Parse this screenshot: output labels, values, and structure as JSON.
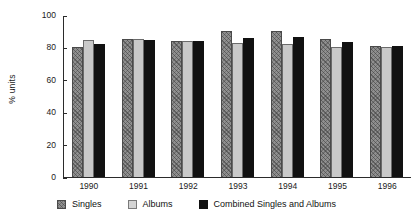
{
  "chart_data": {
    "type": "bar",
    "title": "",
    "xlabel": "",
    "ylabel": "% units",
    "ylim": [
      0,
      100
    ],
    "yticks": [
      0,
      20,
      40,
      60,
      80,
      100
    ],
    "grid": false,
    "legend_position": "bottom",
    "categories": [
      "1990",
      "1991",
      "1992",
      "1993",
      "1994",
      "1995",
      "1996"
    ],
    "series": [
      {
        "name": "Singles",
        "color": "#8f8f8f",
        "fill": "hatched-gray",
        "values": [
          80,
          85,
          84,
          90,
          90,
          85,
          81
        ]
      },
      {
        "name": "Albums",
        "color": "#c9c9c9",
        "fill": "solid-light-gray",
        "values": [
          84.5,
          85.5,
          84,
          82.5,
          82,
          80,
          80
        ]
      },
      {
        "name": "Combined Singles and Albums",
        "color": "#111111",
        "fill": "solid-black",
        "values": [
          82,
          84.5,
          84,
          86,
          86.5,
          83.5,
          81
        ]
      }
    ]
  }
}
